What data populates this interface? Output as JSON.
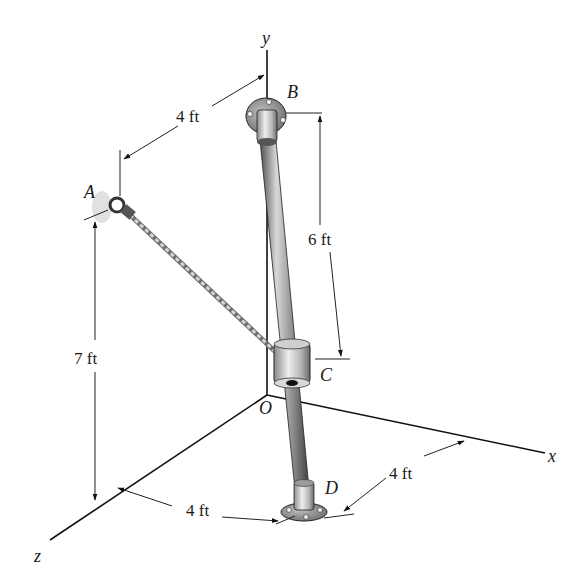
{
  "figure": {
    "type": "3D statics diagram",
    "axes": {
      "x_label": "x",
      "y_label": "y",
      "z_label": "z",
      "origin_label": "O"
    },
    "points": {
      "A": "A",
      "B": "B",
      "C": "C",
      "D": "D"
    },
    "dimensions": {
      "a_to_y_axis": "4 ft",
      "b_to_c": "6 ft",
      "a_height": "7 ft",
      "d_along_z": "4 ft",
      "d_along_x": "4 ft"
    },
    "components": {
      "rod": "rod BD",
      "collar": "collar C",
      "cable": "cable AC",
      "eyebolt": "eyebolt A",
      "bracket_top": "flange bracket B",
      "bracket_bottom": "flange bracket D"
    },
    "colors": {
      "line": "#111111",
      "rod_dark": "#4a4a4a",
      "rod_light": "#c8c8c8",
      "flange": "#8a8a8a",
      "cable": "#9a9a9a"
    }
  }
}
